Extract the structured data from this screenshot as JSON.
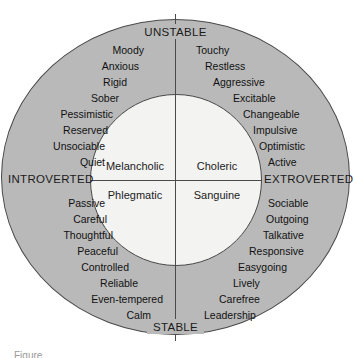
{
  "diagram": {
    "colors": {
      "outer_ring": "#b9b9b9",
      "inner_circle": "#f3f3f2",
      "line": "#4a4a4a",
      "text": "#111111",
      "background": "#ffffff"
    },
    "axes": {
      "vertical": {
        "top_label": "UNSTABLE",
        "bottom_label": "STABLE"
      },
      "horizontal": {
        "left_label": "INTROVERTED",
        "right_label": "EXTROVERTED"
      }
    },
    "temperaments": {
      "upper_left": "Melancholic",
      "upper_right": "Choleric",
      "lower_left": "Phlegmatic",
      "lower_right": "Sanguine"
    },
    "quadrants": {
      "unstable_introverted": {
        "temperament": "Melancholic",
        "traits": [
          "Moody",
          "Anxious",
          "Rigid",
          "Sober",
          "Pessimistic",
          "Reserved",
          "Unsociable",
          "Quiet"
        ]
      },
      "unstable_extroverted": {
        "temperament": "Choleric",
        "traits": [
          "Touchy",
          "Restless",
          "Aggressive",
          "Excitable",
          "Changeable",
          "Impulsive",
          "Optimistic",
          "Active"
        ]
      },
      "stable_introverted": {
        "temperament": "Phlegmatic",
        "traits": [
          "Passive",
          "Careful",
          "Thoughtful",
          "Peaceful",
          "Controlled",
          "Reliable",
          "Even-tempered",
          "Calm"
        ]
      },
      "stable_extroverted": {
        "temperament": "Sanguine",
        "traits": [
          "Sociable",
          "Outgoing",
          "Talkative",
          "Responsive",
          "Easygoing",
          "Lively",
          "Carefree",
          "Leadership"
        ]
      }
    },
    "caption_partial": "Figure"
  }
}
